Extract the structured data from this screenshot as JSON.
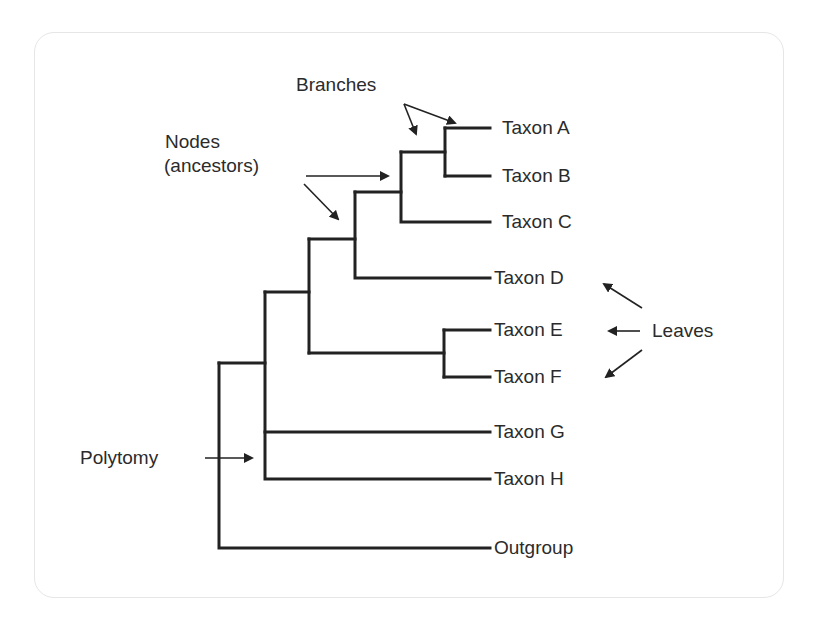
{
  "diagram": {
    "type": "phylogenetic-tree",
    "stroke_color": "#222222",
    "text_color": "#2b2b2b",
    "card_border_color": "#e6e6e6",
    "leaves": [
      {
        "label": "Taxon A",
        "y": 128
      },
      {
        "label": "Taxon B",
        "y": 176
      },
      {
        "label": "Taxon C",
        "y": 222
      },
      {
        "label": "Taxon D",
        "y": 278
      },
      {
        "label": "Taxon E",
        "y": 330
      },
      {
        "label": "Taxon F",
        "y": 377
      },
      {
        "label": "Taxon G",
        "y": 432
      },
      {
        "label": "Taxon H",
        "y": 479
      },
      {
        "label": "Outgroup",
        "y": 548
      }
    ],
    "annotations": {
      "branches": "Branches",
      "nodes_line1": "Nodes",
      "nodes_line2": "(ancestors)",
      "leaves": "Leaves",
      "polytomy": "Polytomy"
    },
    "structure": "(Outgroup,(((((A,B),C),D),(E,F)),G,H))"
  }
}
